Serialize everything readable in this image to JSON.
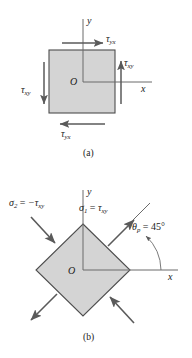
{
  "figure": {
    "fill_color": "#d4d4d4",
    "stroke_color": "#4d4d4d",
    "arrow_color": "#5a5a5a"
  },
  "panel_a": {
    "caption": "(a)",
    "origin_label": "O",
    "axis_x_label": "x",
    "axis_y_label": "y",
    "shear_top": {
      "symbol": "τ",
      "sub": "yx",
      "direction": "right"
    },
    "shear_bottom": {
      "symbol": "τ",
      "sub": "yx",
      "direction": "left"
    },
    "shear_left": {
      "symbol": "τ",
      "sub": "xy",
      "direction": "down"
    },
    "shear_right": {
      "symbol": "τ",
      "sub": "xy",
      "direction": "up"
    }
  },
  "panel_b": {
    "caption": "(b)",
    "origin_label": "O",
    "axis_x_label": "x",
    "axis_y_label": "y",
    "sigma2": {
      "symbol": "σ",
      "sub": "2",
      "relation": "=",
      "value": "−τ",
      "value_sub": "xy"
    },
    "sigma1": {
      "symbol": "σ",
      "sub": "1",
      "relation": "=",
      "value": "τ",
      "value_sub": "xy"
    },
    "theta": {
      "symbol": "θ",
      "sub": "p",
      "relation": "=",
      "value": "45°"
    }
  }
}
